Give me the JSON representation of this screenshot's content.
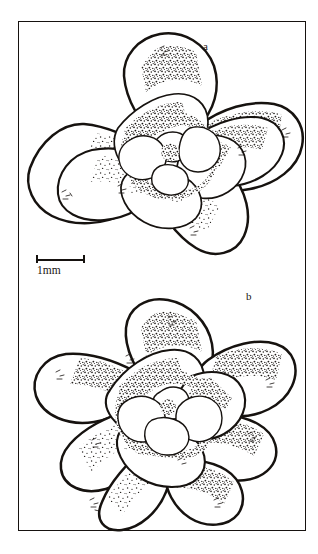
{
  "plate": {
    "title": "Rosette habit line drawings",
    "background_color": "#ffffff",
    "ink_color": "#16120f",
    "frame": {
      "present": true,
      "style": "thin black rectangle",
      "x": 18,
      "y": 21,
      "width": 288,
      "height": 510
    }
  },
  "panels": [
    {
      "id": "a",
      "label": "a",
      "label_x": 203,
      "label_y": 41,
      "description": "Stippled ink drawing of a compact succulent rosette viewed from above, four broad outer leaves in near-cruciform arrangement with overlapping inner whorls and small central leaves.",
      "leaf_count_outer": 4,
      "technique": "pen and ink stipple shading",
      "center_x": 165,
      "center_y": 145
    },
    {
      "id": "b",
      "label": "b",
      "label_x": 246,
      "label_y": 291,
      "description": "Stippled ink drawing of a succulent rosette viewed from above with six to seven spreading outer leaves forming a star outline and tightly imbricate inner leaves.",
      "leaf_count_outer": 7,
      "technique": "pen and ink stipple shading",
      "center_x": 160,
      "center_y": 405
    }
  ],
  "scalebar": {
    "label": "1mm",
    "x": 36,
    "y": 255,
    "bar_length_px": 49,
    "represents": "1 mm",
    "has_end_caps": true
  }
}
